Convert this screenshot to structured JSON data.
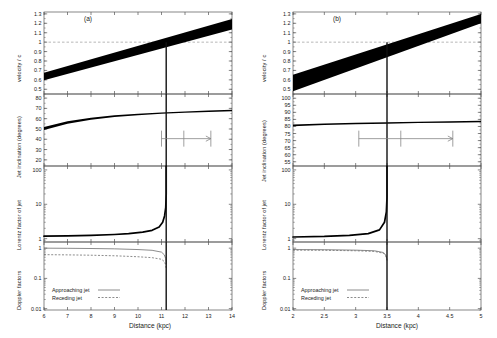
{
  "figure": {
    "background": "#ffffff",
    "foreground": "#000000",
    "axis_color": "#555555",
    "band_color": "#000000",
    "dash_color": "#999999",
    "marker_color": "#888888",
    "width": 497,
    "height": 338
  },
  "chart_data": [
    {
      "type": "line",
      "panel": "a",
      "panel_label": "(a)",
      "title": "",
      "xlabel": "Distance (kpc)",
      "xlim": [
        6,
        14
      ],
      "xticks": [
        6,
        7,
        8,
        9,
        10,
        11,
        12,
        13,
        14
      ],
      "xticklabels": [
        "6",
        "7",
        "8",
        "9",
        "10",
        "11",
        "12",
        "13",
        "14"
      ],
      "grid": false,
      "legend_position": "lower-left",
      "vertical_marker": 11.2,
      "error_bar": {
        "low": 11.0,
        "center": 11.95,
        "high": 13.1,
        "arrow": "right"
      },
      "subplots": [
        {
          "name": "velocity",
          "ylabel": "velocity / c",
          "ylim": [
            0.45,
            1.32
          ],
          "yticks": [
            0.5,
            0.6,
            0.7,
            0.8,
            0.9,
            1.0,
            1.1,
            1.2,
            1.3
          ],
          "yticklabels": [
            "0.5",
            "0.6",
            "0.7",
            "0.8",
            "0.9",
            "1",
            "1.1",
            "1.2",
            "1.3"
          ],
          "yscale": "linear",
          "reference_line": {
            "y": 1.0,
            "style": "dashed"
          },
          "band": {
            "x": [
              6,
              14
            ],
            "lower": [
              0.595,
              1.135
            ],
            "upper": [
              0.675,
              1.245
            ],
            "fill": "#000000"
          }
        },
        {
          "name": "jet-inclination",
          "ylabel": "Jet inclination (degrees)",
          "ylim": [
            14,
            84
          ],
          "yticks": [
            20,
            30,
            40,
            50,
            60,
            70,
            80
          ],
          "yticklabels": [
            "20",
            "30",
            "40",
            "50",
            "60",
            "70",
            "80"
          ],
          "yscale": "linear",
          "band": {
            "x": [
              6,
              7,
              8,
              9,
              10,
              11,
              12,
              13,
              14
            ],
            "lower": [
              49.0,
              55.0,
              59.0,
              61.6,
              63.4,
              64.7,
              65.8,
              66.6,
              67.3
            ],
            "upper": [
              52.0,
              57.4,
              61.0,
              63.3,
              64.9,
              66.1,
              67.1,
              67.9,
              68.6
            ],
            "fill": "#000000"
          }
        },
        {
          "name": "lorentz-factor",
          "ylabel": "Lorentz factor of jet",
          "ylim": [
            0.8,
            130
          ],
          "yticks": [
            1,
            10,
            100
          ],
          "yticklabels": [
            "1",
            "10",
            "100"
          ],
          "yscale": "log",
          "curve": {
            "x": [
              6,
              7,
              8,
              9,
              9.6,
              10.2,
              10.6,
              10.9,
              11.05,
              11.13,
              11.18,
              11.2
            ],
            "y": [
              1.18,
              1.2,
              1.24,
              1.32,
              1.4,
              1.55,
              1.75,
              2.2,
              3.0,
              4.6,
              8.0,
              20.0
            ]
          }
        },
        {
          "name": "doppler-factors",
          "ylabel": "Doppler factors",
          "ylim": [
            0.009,
            1.6
          ],
          "yticks": [
            0.01,
            0.1,
            1
          ],
          "yticklabels": [
            "0.01",
            "0.1",
            "1"
          ],
          "yscale": "log",
          "series": [
            {
              "name": "Approaching jet",
              "style": "solid",
              "x": [
                6,
                7,
                8,
                9,
                10,
                10.6,
                11.0,
                11.12,
                11.18,
                11.2
              ],
              "y": [
                1.0,
                0.99,
                0.975,
                0.95,
                0.9,
                0.85,
                0.74,
                0.6,
                0.45,
                0.3
              ]
            },
            {
              "name": "Receding jet",
              "style": "dashed",
              "x": [
                6,
                7,
                8,
                9,
                10,
                10.6,
                11.0,
                11.12,
                11.18,
                11.2
              ],
              "y": [
                0.61,
                0.6,
                0.585,
                0.56,
                0.52,
                0.485,
                0.43,
                0.36,
                0.28,
                0.2
              ]
            }
          ]
        }
      ]
    },
    {
      "type": "line",
      "panel": "b",
      "panel_label": "(b)",
      "title": "",
      "xlabel": "Distance (kpc)",
      "xlim": [
        2,
        5
      ],
      "xticks": [
        2,
        2.5,
        3,
        3.5,
        4,
        4.5,
        5
      ],
      "xticklabels": [
        "2",
        "2.5",
        "3",
        "3.5",
        "4",
        "4.5",
        "5"
      ],
      "grid": false,
      "legend_position": "lower-left",
      "vertical_marker": 3.5,
      "error_bar": {
        "low": 3.05,
        "center": 3.72,
        "high": 4.55,
        "arrow": "right"
      },
      "subplots": [
        {
          "name": "velocity",
          "ylabel": "velocity / c",
          "ylim": [
            0.45,
            1.32
          ],
          "yticks": [
            0.5,
            0.6,
            0.7,
            0.8,
            0.9,
            1.0,
            1.1,
            1.2,
            1.3
          ],
          "yticklabels": [
            "0.5",
            "0.6",
            "0.7",
            "0.8",
            "0.9",
            "1",
            "1.1",
            "1.2",
            "1.3"
          ],
          "yscale": "linear",
          "reference_line": {
            "y": 1.0,
            "style": "dashed"
          },
          "band": {
            "x": [
              2,
              5
            ],
            "lower": [
              0.48,
              1.2
            ],
            "upper": [
              0.655,
              1.42
            ],
            "fill": "#000000",
            "clip_top": 1.3
          }
        },
        {
          "name": "jet-inclination",
          "ylabel": "Jet inclination (degrees)",
          "ylim": [
            52,
            103
          ],
          "yticks": [
            55,
            60,
            65,
            70,
            75,
            80,
            85,
            90,
            95,
            100
          ],
          "yticklabels": [
            "55",
            "60",
            "65",
            "70",
            "75",
            "80",
            "85",
            "90",
            "95",
            "100"
          ],
          "yscale": "linear",
          "band": {
            "x": [
              2,
              2.5,
              3,
              3.5,
              4,
              4.5,
              5
            ],
            "lower": [
              80.2,
              81.0,
              81.5,
              82.0,
              82.4,
              82.7,
              83.0
            ],
            "upper": [
              81.4,
              82.1,
              82.6,
              83.0,
              83.4,
              83.7,
              84.0
            ],
            "fill": "#000000"
          }
        },
        {
          "name": "lorentz-factor",
          "ylabel": "Lorentz factor of jet",
          "ylim": [
            0.8,
            130
          ],
          "yticks": [
            1,
            10,
            100
          ],
          "yticklabels": [
            "1",
            "10",
            "100"
          ],
          "yscale": "log",
          "curve": {
            "x": [
              2,
              2.5,
              2.9,
              3.2,
              3.38,
              3.46,
              3.49,
              3.5
            ],
            "y": [
              1.12,
              1.16,
              1.24,
              1.4,
              1.8,
              3.0,
              6.0,
              16.0
            ]
          }
        },
        {
          "name": "doppler-factors",
          "ylabel": "Doppler factors",
          "ylim": [
            0.009,
            1.6
          ],
          "yticks": [
            0.01,
            0.1,
            1
          ],
          "yticklabels": [
            "0.01",
            "0.1",
            "1"
          ],
          "yscale": "log",
          "series": [
            {
              "name": "Approaching jet",
              "style": "solid",
              "x": [
                2,
                2.5,
                3,
                3.3,
                3.44,
                3.48,
                3.5
              ],
              "y": [
                0.9,
                0.89,
                0.86,
                0.82,
                0.72,
                0.6,
                0.42
              ]
            },
            {
              "name": "Receding jet",
              "style": "dashed",
              "x": [
                2,
                2.5,
                3,
                3.3,
                3.44,
                3.48,
                3.5
              ],
              "y": [
                0.86,
                0.85,
                0.82,
                0.78,
                0.68,
                0.56,
                0.39
              ]
            }
          ]
        }
      ]
    }
  ],
  "legend": {
    "approaching_label": "Approaching jet",
    "receding_label": "Receding jet"
  }
}
